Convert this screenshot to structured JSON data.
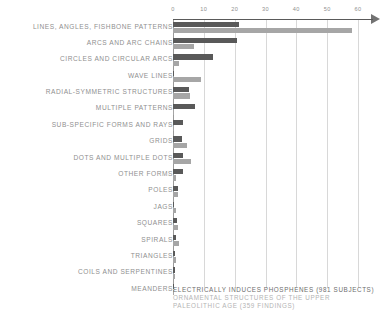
{
  "chart_data": {
    "type": "bar",
    "orientation": "horizontal",
    "title": "",
    "subtitle": "",
    "xlabel": "",
    "ylabel": "",
    "xlim": [
      0,
      60
    ],
    "xticks": [
      0,
      10,
      20,
      30,
      40,
      50,
      60
    ],
    "xtick_labels": [
      "0",
      "10",
      "20",
      "30",
      "40",
      "50",
      "60"
    ],
    "grid": true,
    "grid_axis": "x",
    "legend_position": "bottom-left",
    "axis_arrow": true,
    "categories": [
      "LINES, ANGLES, FISHBONE PATTERNS",
      "ARCS AND ARC CHAINS",
      "CIRCLES AND CIRCULAR ARCS",
      "WAVE LINES",
      "RADIAL-SYMMETRIC STRUCTURES",
      "MULTIPLE PATTERNS",
      "SUB-SPECIFIC FORMS AND RAYS",
      "GRIDS",
      "DOTS AND MULTIPLE DOTS",
      "OTHER FORMS",
      "POLES",
      "JAGS",
      "SQUARES",
      "SPIRALS",
      "TRIANGLES",
      "COILS AND SERPENTINES",
      "MEANDERS"
    ],
    "series": [
      {
        "name": "ELECTRICALLY INDUCES PHOSPHENES (981 SUBJECTS)",
        "color": "#595959",
        "values": [
          21.5,
          20.8,
          13.0,
          0.4,
          5.3,
          7.2,
          3.4,
          2.9,
          3.4,
          3.1,
          1.5,
          0.3,
          1.2,
          1.1,
          0.8,
          0.5,
          0.3
        ]
      },
      {
        "name": "ORNAMENTAL STRUCTURES OF THE UPPER PALEOLITHIC AGE (359 FINDINGS)",
        "color": "#a6a6a6",
        "values": [
          58.0,
          6.8,
          1.9,
          9.2,
          5.6,
          0.3,
          0.4,
          4.6,
          5.8,
          1.0,
          1.5,
          0.9,
          1.6,
          1.9,
          1.0,
          0.6,
          0.4
        ]
      }
    ]
  },
  "legend": {
    "entries": [
      {
        "label": "ELECTRICALLY INDUCES PHOSPHENES (981 SUBJECTS)"
      },
      {
        "label": "ORNAMENTAL STRUCTURES OF THE UPPER"
      },
      {
        "label": "PALEOLITHIC AGE (359 FINDINGS)"
      }
    ]
  }
}
